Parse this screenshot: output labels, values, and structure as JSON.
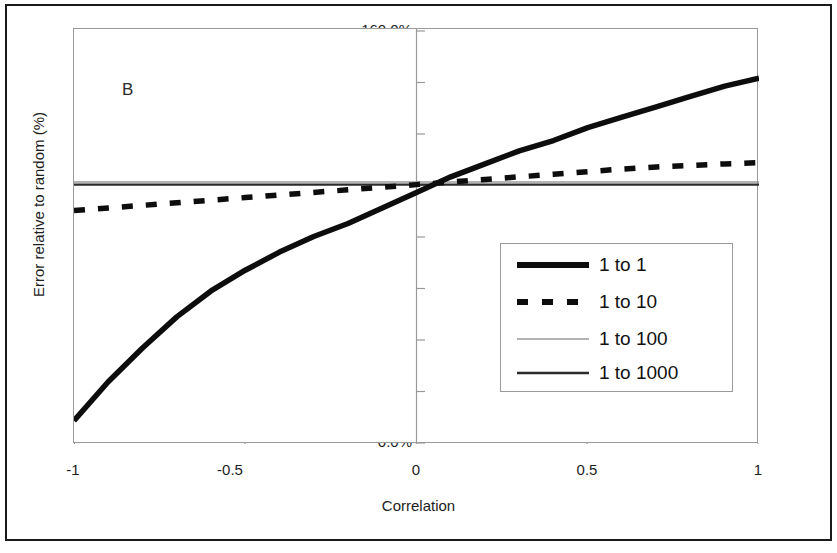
{
  "figure": {
    "panel_label": "B",
    "xlabel": "Correlation",
    "ylabel": "Error relative to random (%)"
  },
  "axes": {
    "y_ticks": [
      "0.0%",
      "20.0%",
      "40.0%",
      "60.0%",
      "80.0%",
      "100.0%",
      "120.0%",
      "140.0%",
      "160.0%"
    ],
    "x_ticks": [
      "-1",
      "-0.5",
      "0",
      "0.5",
      "1"
    ]
  },
  "legend": {
    "items": [
      {
        "label": "1 to 1",
        "style": "thick-solid",
        "color": "#0d0d0d"
      },
      {
        "label": "1 to 10",
        "style": "thick-dashed",
        "color": "#0d0d0d"
      },
      {
        "label": "1 to 100",
        "style": "thin-solid",
        "color": "#9a9a9a"
      },
      {
        "label": "1 to 1000",
        "style": "medium-solid",
        "color": "#2b2b2b"
      }
    ]
  },
  "chart_data": {
    "type": "line",
    "title": "",
    "subtitle": "",
    "panel": "B",
    "xlabel": "Correlation",
    "ylabel": "Error relative to random (%)",
    "xlim": [
      -1,
      1
    ],
    "ylim": [
      0,
      160
    ],
    "y_tick_values": [
      0,
      20,
      40,
      60,
      80,
      100,
      120,
      140,
      160
    ],
    "y_tick_labels": [
      "0.0%",
      "20.0%",
      "40.0%",
      "60.0%",
      "80.0%",
      "100.0%",
      "120.0%",
      "140.0%",
      "160.0%"
    ],
    "x_tick_values": [
      -1,
      -0.5,
      0,
      0.5,
      1
    ],
    "x_tick_labels": [
      "-1",
      "-0.5",
      "0",
      "0.5",
      "1"
    ],
    "grid": false,
    "legend_position": "center-right",
    "x": [
      -1.0,
      -0.9,
      -0.8,
      -0.7,
      -0.6,
      -0.5,
      -0.4,
      -0.3,
      -0.2,
      -0.1,
      0.0,
      0.1,
      0.2,
      0.3,
      0.4,
      0.5,
      0.6,
      0.7,
      0.8,
      0.9,
      1.0
    ],
    "series": [
      {
        "name": "1 to 1",
        "style": "thick-solid",
        "color": "#0d0d0d",
        "values": [
          9.0,
          24.0,
          37.0,
          49.0,
          59.0,
          67.0,
          74.0,
          80.0,
          85.0,
          91.0,
          97.0,
          103.0,
          108.0,
          113.0,
          117.0,
          122.0,
          126.0,
          130.0,
          134.0,
          138.0,
          141.0
        ]
      },
      {
        "name": "1 to 10",
        "style": "thick-dashed",
        "color": "#0d0d0d",
        "values": [
          90.0,
          91.0,
          92.0,
          93.0,
          94.0,
          95.0,
          96.0,
          97.0,
          98.0,
          99.0,
          100.0,
          101.0,
          102.0,
          103.0,
          104.0,
          105.0,
          106.0,
          106.8,
          107.4,
          108.0,
          108.5
        ]
      },
      {
        "name": "1 to 100",
        "style": "thin-solid",
        "color": "#9a9a9a",
        "values": [
          101.0,
          101.0,
          101.0,
          101.0,
          101.0,
          101.0,
          101.0,
          101.0,
          101.0,
          101.0,
          101.0,
          101.0,
          101.0,
          101.0,
          101.0,
          101.0,
          101.0,
          101.0,
          101.0,
          101.0,
          101.0
        ]
      },
      {
        "name": "1 to 1000",
        "style": "medium-solid",
        "color": "#2b2b2b",
        "values": [
          100.0,
          100.0,
          100.0,
          100.0,
          100.0,
          100.0,
          100.0,
          100.0,
          100.0,
          100.0,
          100.0,
          100.0,
          100.0,
          100.0,
          100.0,
          100.0,
          100.0,
          100.0,
          100.0,
          100.0,
          100.0
        ]
      }
    ]
  }
}
